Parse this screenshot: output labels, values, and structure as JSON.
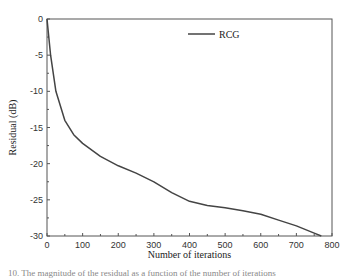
{
  "chart_data": {
    "type": "line",
    "title": "",
    "xlabel": "Number of iterations",
    "ylabel": "Residual (dB)",
    "xlim": [
      0,
      800
    ],
    "ylim": [
      -30,
      0
    ],
    "xticks": [
      0,
      100,
      200,
      300,
      400,
      500,
      600,
      700,
      800
    ],
    "yticks": [
      0,
      -5,
      -10,
      -15,
      -20,
      -25,
      -30
    ],
    "legend": {
      "position": "upper right",
      "entries": [
        "RCG"
      ]
    },
    "grid": false,
    "series": [
      {
        "name": "RCG",
        "color": "#444444",
        "x": [
          0,
          10,
          25,
          50,
          75,
          100,
          150,
          200,
          250,
          300,
          350,
          400,
          450,
          500,
          550,
          600,
          650,
          700,
          750,
          770
        ],
        "y": [
          0,
          -5,
          -10,
          -14,
          -16,
          -17.2,
          -19,
          -20.3,
          -21.3,
          -22.5,
          -24,
          -25.2,
          -25.8,
          -26.1,
          -26.5,
          -27,
          -27.8,
          -28.6,
          -29.6,
          -30
        ]
      }
    ]
  },
  "caption": "10. The magnitude of the residual as a function of the number of iterations"
}
